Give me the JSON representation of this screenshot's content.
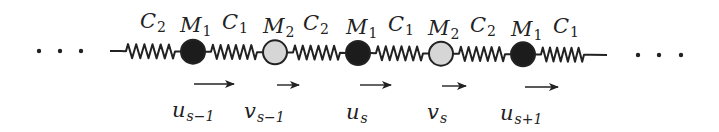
{
  "diagram": {
    "colors": {
      "heavy_mass": "#1c1c1c",
      "light_mass": "#d6d6d6",
      "line": "#222222",
      "background": "#ffffff"
    },
    "chain_y_left": 51,
    "chain_y_right": 55,
    "line_start_x": 110,
    "line_end_x": 607,
    "ellipsis_left": {
      "dots_x": [
        39,
        60,
        81
      ],
      "y": 51
    },
    "ellipsis_right": {
      "dots_x": [
        638,
        659,
        681
      ],
      "y": 55
    },
    "masses": [
      {
        "id": "M1",
        "x": 193,
        "type": "heavy",
        "label": "M",
        "sub": "1",
        "label_x": 180,
        "label_y": 15
      },
      {
        "id": "M2",
        "x": 275,
        "type": "light",
        "label": "M",
        "sub": "2",
        "label_x": 263,
        "label_y": 16
      },
      {
        "id": "M1",
        "x": 358,
        "type": "heavy",
        "label": "M",
        "sub": "1",
        "label_x": 346,
        "label_y": 17
      },
      {
        "id": "M2",
        "x": 441,
        "type": "light",
        "label": "M",
        "sub": "2",
        "label_x": 428,
        "label_y": 18
      },
      {
        "id": "M1",
        "x": 523,
        "type": "heavy",
        "label": "M",
        "sub": "1",
        "label_x": 511,
        "label_y": 19
      }
    ],
    "springs": [
      {
        "label": "C",
        "sub": "2",
        "x1": 120,
        "x2": 181,
        "label_x": 140,
        "label_y": 11
      },
      {
        "label": "C",
        "sub": "1",
        "x1": 205,
        "x2": 263,
        "label_x": 222,
        "label_y": 12
      },
      {
        "label": "C",
        "sub": "2",
        "x1": 287,
        "x2": 346,
        "label_x": 303,
        "label_y": 13
      },
      {
        "label": "C",
        "sub": "1",
        "x1": 370,
        "x2": 429,
        "label_x": 388,
        "label_y": 14
      },
      {
        "label": "C",
        "sub": "2",
        "x1": 453,
        "x2": 511,
        "label_x": 470,
        "label_y": 15
      },
      {
        "label": "C",
        "sub": "1",
        "x1": 535,
        "x2": 590,
        "label_x": 553,
        "label_y": 16
      }
    ],
    "displacements": [
      {
        "symbol": "u",
        "sub": "s−1",
        "arrow_x1": 194,
        "arrow_x2": 234,
        "arrow_y": 84,
        "label_x": 172,
        "label_y": 100
      },
      {
        "symbol": "v",
        "sub": "s−1",
        "arrow_x1": 277,
        "arrow_x2": 299,
        "arrow_y": 85,
        "label_x": 244,
        "label_y": 101
      },
      {
        "symbol": "u",
        "sub": "s",
        "arrow_x1": 360,
        "arrow_x2": 391,
        "arrow_y": 85,
        "label_x": 346,
        "label_y": 102
      },
      {
        "symbol": "v",
        "sub": "s",
        "arrow_x1": 442,
        "arrow_x2": 466,
        "arrow_y": 86,
        "label_x": 427,
        "label_y": 102
      },
      {
        "symbol": "u",
        "sub": "s+1",
        "arrow_x1": 525,
        "arrow_x2": 558,
        "arrow_y": 87,
        "label_x": 500,
        "label_y": 103
      }
    ]
  }
}
